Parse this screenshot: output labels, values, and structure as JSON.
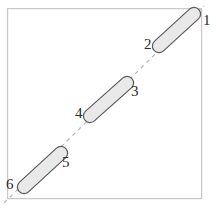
{
  "figure": {
    "kind": "geometry-diagram",
    "frame": {
      "name": "outer-square-frame",
      "x": 7,
      "y": 8,
      "width": 195,
      "height": 191,
      "stroke": "#c8c8c8",
      "stroke_width": 1.2,
      "fill": "#ffffff"
    },
    "dashed_line": {
      "name": "diagonal-dashed-axis",
      "x1": 4,
      "y1": 203,
      "x2": 204,
      "y2": 6,
      "stroke": "#b0b0b0",
      "stroke_width": 1.1,
      "dash_pattern": "4 4"
    },
    "rods": [
      {
        "name": "rod-1-2",
        "x1": 159,
        "y1": 46,
        "x2": 194,
        "y2": 14,
        "thickness": 13,
        "fill": "#e8e8e8",
        "stroke": "#5a5a5a",
        "stroke_width": 1.2
      },
      {
        "name": "rod-3-4",
        "x1": 90,
        "y1": 116,
        "x2": 127,
        "y2": 83,
        "thickness": 13,
        "fill": "#e8e8e8",
        "stroke": "#5a5a5a",
        "stroke_width": 1.2
      },
      {
        "name": "rod-5-6",
        "x1": 24,
        "y1": 187,
        "x2": 61,
        "y2": 153,
        "thickness": 13,
        "fill": "#e8e8e8",
        "stroke": "#5a5a5a",
        "stroke_width": 1.2
      }
    ],
    "labels": [
      {
        "name": "point-label-1",
        "text": "1",
        "x": 204,
        "y": 24,
        "anchor": "start"
      },
      {
        "name": "point-label-2",
        "text": "2",
        "x": 145,
        "y": 48,
        "anchor": "start"
      },
      {
        "name": "point-label-3",
        "text": "3",
        "x": 131,
        "y": 95,
        "anchor": "start"
      },
      {
        "name": "point-label-4",
        "text": "4",
        "x": 76,
        "y": 117,
        "anchor": "start"
      },
      {
        "name": "point-label-5",
        "text": "5",
        "x": 62,
        "y": 166,
        "anchor": "start"
      },
      {
        "name": "point-label-6",
        "text": "6",
        "x": 7,
        "y": 188,
        "anchor": "start"
      }
    ],
    "colors": {
      "rod_fill": "#e8e8e8",
      "rod_stroke": "#5a5a5a",
      "frame_stroke": "#c8c8c8",
      "dash_stroke": "#b0b0b0",
      "label_color": "#2b2b2b",
      "background": "#ffffff"
    }
  }
}
